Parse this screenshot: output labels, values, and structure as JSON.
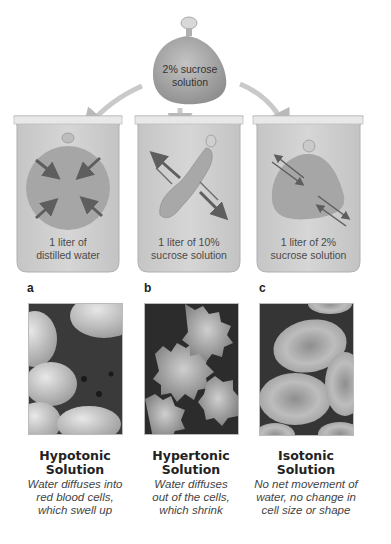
{
  "figure": {
    "source_bag": {
      "label_line1": "2% sucrose",
      "label_line2": "solution"
    },
    "beakers": [
      {
        "letter": "a",
        "line1": "1 liter of",
        "line2": "distilled water"
      },
      {
        "letter": "b",
        "line1": "1 liter of 10%",
        "line2": "sucrose solution"
      },
      {
        "letter": "c",
        "line1": "1 liter of 2%",
        "line2": "sucrose solution"
      }
    ],
    "captions": [
      {
        "title1": "Hypotonic",
        "title2": "Solution",
        "desc1": "Water diffuses into",
        "desc2": "red blood cells,",
        "desc3": "which swell up"
      },
      {
        "title1": "Hypertonic",
        "title2": "Solution",
        "desc1": "Water diffuses",
        "desc2": "out of the cells,",
        "desc3": "which shrink"
      },
      {
        "title1": "Isotonic",
        "title2": "Solution",
        "desc1": "No net movement of",
        "desc2": "water, no change in",
        "desc3": "cell size or shape"
      }
    ],
    "colors": {
      "beaker_fill": "#cfcfcf",
      "beaker_rim": "#e6e6e6",
      "bag_fill": "#a9a9a9",
      "arrow": "#6a6a6a",
      "flow_arrow": "#c8c8c8"
    }
  }
}
